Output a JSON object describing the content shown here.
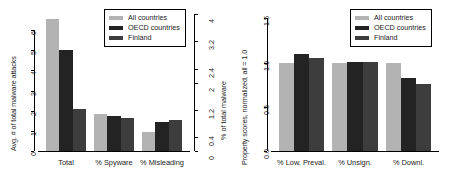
{
  "chart_data": [
    {
      "panel": "left",
      "type": "bar",
      "title": "",
      "categories": [
        "Total",
        "% Spyware",
        "% Misleading"
      ],
      "series": [
        {
          "name": "All countries",
          "values": [
            6.55,
            1.85,
            0.95
          ],
          "color": "#b3b3b3"
        },
        {
          "name": "OECD countries",
          "values": [
            5.0,
            1.75,
            1.45
          ],
          "color": "#232323"
        },
        {
          "name": "Finland",
          "values": [
            2.1,
            1.62,
            1.52
          ],
          "color": "#3d3d3d"
        }
      ],
      "xlabel": "",
      "ylabel": "Avg. # of total malware attacks",
      "ylim": [
        0,
        6.8
      ],
      "yticks": [
        "0",
        "1",
        "2",
        "3",
        "4",
        "5",
        "6"
      ],
      "ytickvals": [
        0,
        1,
        2,
        3,
        4,
        5,
        6
      ],
      "y2label": "% of total malware",
      "y2lim": [
        0,
        4
      ],
      "y2ticks": [
        "0",
        "0.4",
        "1.2",
        "2",
        "2.4",
        "3.2",
        "4"
      ],
      "y2tickvals": [
        0,
        0.4,
        1.2,
        2,
        2.4,
        3.2,
        4
      ],
      "grid": false,
      "legend_position": "top-right"
    },
    {
      "panel": "right",
      "type": "bar",
      "title": "",
      "categories": [
        "% Low. Preval.",
        "% Unsign.",
        "% Downl."
      ],
      "series": [
        {
          "name": "All countries",
          "values": [
            1.0,
            1.0,
            1.0
          ],
          "color": "#b3b3b3"
        },
        {
          "name": "OECD countries",
          "values": [
            1.1,
            1.01,
            0.83
          ],
          "color": "#232323"
        },
        {
          "name": "Finland",
          "values": [
            1.05,
            1.01,
            0.76
          ],
          "color": "#3d3d3d"
        }
      ],
      "xlabel": "",
      "ylabel": "Property scores, normalized, all = 1.0",
      "ylim": [
        0,
        1.55
      ],
      "yticks": [
        "0.0",
        "0.5",
        "1.0",
        "1.5"
      ],
      "ytickvals": [
        0,
        0.5,
        1.0,
        1.5
      ],
      "grid": false,
      "legend_position": "top-right"
    }
  ],
  "legend": {
    "entries": [
      {
        "label": "All countries",
        "color": "#b3b3b3"
      },
      {
        "label": "OECD countries",
        "color": "#232323"
      },
      {
        "label": "Finland",
        "color": "#3d3d3d"
      }
    ]
  }
}
